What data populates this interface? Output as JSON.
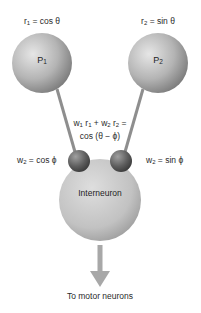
{
  "diagram": {
    "neurons": {
      "p1": {
        "label": "P",
        "sub": "1",
        "caption_var": "r",
        "caption_sub": "1",
        "caption_rest": " = cos θ"
      },
      "p2": {
        "label": "P",
        "sub": "2",
        "caption_var": "r",
        "caption_sub": "2",
        "caption_rest": " = sin θ"
      },
      "interneuron": {
        "label": "Interneuron"
      }
    },
    "weights": {
      "left": {
        "var": "w",
        "sub": "2",
        "rest": " = cos ϕ"
      },
      "right": {
        "var": "w",
        "sub": "2",
        "rest": " = sin ϕ"
      }
    },
    "equation": {
      "line1_parts": [
        "w",
        "1",
        " r",
        "1",
        " + w",
        "2",
        " r",
        "2",
        " ="
      ],
      "line2": "cos (θ − ϕ)"
    },
    "output": {
      "label": "To motor neurons"
    },
    "colors": {
      "sphere_light": "#d8d8d8",
      "sphere_dark": "#8a8a8a",
      "synapse_dark": "#5a5a5a",
      "line": "#9a9a9a",
      "arrow": "#a8a8a8"
    }
  }
}
